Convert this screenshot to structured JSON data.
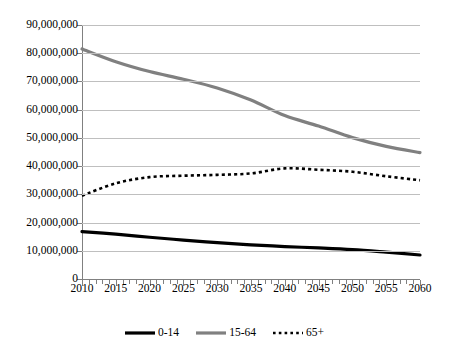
{
  "chart_data": {
    "type": "line",
    "title": "",
    "subtitle": "",
    "xlabel": "",
    "ylabel": "",
    "xlim": [
      2010,
      2060
    ],
    "ylim": [
      0,
      90000000
    ],
    "grid": "horizontal",
    "legend_position": "bottom-center",
    "x_tick_labels": [
      "2010",
      "2015",
      "2020",
      "2025",
      "2030",
      "2035",
      "2040",
      "2045",
      "2050",
      "2055",
      "2060"
    ],
    "x_tick_values": [
      2010,
      2015,
      2020,
      2025,
      2030,
      2035,
      2040,
      2045,
      2050,
      2055,
      2060
    ],
    "y_tick_labels": [
      "0",
      "10,000,000",
      "20,000,000",
      "30,000,000",
      "40,000,000",
      "50,000,000",
      "60,000,000",
      "70,000,000",
      "80,000,000",
      "90,000,000"
    ],
    "y_tick_values": [
      0,
      10000000,
      20000000,
      30000000,
      40000000,
      50000000,
      60000000,
      70000000,
      80000000,
      90000000
    ],
    "x": [
      2010,
      2015,
      2020,
      2025,
      2030,
      2035,
      2040,
      2045,
      2050,
      2055,
      2060
    ],
    "series": [
      {
        "name": "0-14",
        "color": "#000000",
        "style": "solid",
        "width": 3.2,
        "values": [
          16800000,
          15900000,
          14800000,
          13800000,
          12900000,
          12100000,
          11500000,
          11000000,
          10400000,
          9500000,
          8500000
        ]
      },
      {
        "name": "15-64",
        "color": "#808080",
        "style": "solid",
        "width": 3.2,
        "values": [
          81500000,
          77000000,
          73500000,
          70800000,
          67700000,
          63400000,
          57900000,
          54200000,
          50100000,
          47000000,
          44800000
        ]
      },
      {
        "name": "65+",
        "color": "#000000",
        "style": "dotted",
        "width": 2.6,
        "values": [
          29500000,
          33900000,
          36100000,
          36600000,
          36900000,
          37400000,
          39200000,
          38700000,
          38000000,
          36400000,
          35000000
        ]
      }
    ],
    "legend": [
      {
        "label": "0-14",
        "color": "#000000",
        "style": "solid"
      },
      {
        "label": "15-64",
        "color": "#808080",
        "style": "solid"
      },
      {
        "label": "65+",
        "color": "#000000",
        "style": "dotted"
      }
    ]
  },
  "colors": {
    "background": "#ffffff",
    "gridline": "#bfbfbf",
    "axis": "#808080",
    "text": "#000000",
    "series_0_14": "#000000",
    "series_15_64": "#808080",
    "series_65_plus": "#000000"
  }
}
